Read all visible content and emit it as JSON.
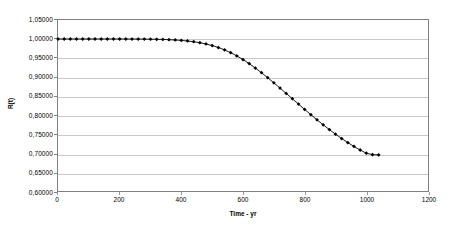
{
  "chart_data": {
    "type": "line",
    "title": "",
    "xlabel": "Time - yr",
    "ylabel": "R(t)",
    "xlim": [
      0,
      1200
    ],
    "ylim": [
      0.6,
      1.05
    ],
    "grid": true,
    "legend": null,
    "decimal_separator": ",",
    "marker": "diamond",
    "marker_color": "#000000",
    "line_color": "#000000",
    "grid_color": "#c9c9c9",
    "frame_color": "#808080",
    "x_ticks": [
      0,
      200,
      400,
      600,
      800,
      1000,
      1200
    ],
    "x_tick_labels": [
      "0",
      "200",
      "400",
      "600",
      "800",
      "1000",
      "1200"
    ],
    "y_ticks": [
      0.6,
      0.65,
      0.7,
      0.75,
      0.8,
      0.85,
      0.9,
      0.95,
      1.0,
      1.05
    ],
    "y_tick_labels": [
      "0,60000",
      "0,65000",
      "0,70000",
      "0,75000",
      "0,80000",
      "0,85000",
      "0,90000",
      "0,95000",
      "1,00000",
      "1,05000"
    ],
    "series": [
      {
        "name": "R(t)",
        "x": [
          0,
          20,
          40,
          60,
          80,
          100,
          120,
          140,
          160,
          180,
          200,
          220,
          240,
          260,
          280,
          300,
          320,
          340,
          360,
          380,
          400,
          420,
          440,
          460,
          480,
          500,
          520,
          540,
          560,
          580,
          600,
          620,
          640,
          660,
          680,
          700,
          720,
          740,
          760,
          780,
          800,
          820,
          840,
          860,
          880,
          900,
          920,
          940,
          960,
          980,
          1000,
          1020,
          1040
        ],
        "values": [
          1.0,
          1.0,
          1.0,
          1.0,
          1.0,
          1.0,
          1.0,
          1.0,
          1.0,
          1.0,
          1.0,
          1.0,
          0.9999,
          0.9998,
          0.9997,
          0.9995,
          0.9992,
          0.9988,
          0.9982,
          0.9974,
          0.9963,
          0.9948,
          0.9928,
          0.9902,
          0.9869,
          0.9827,
          0.9776,
          0.9714,
          0.964,
          0.9555,
          0.9459,
          0.9352,
          0.9236,
          0.9112,
          0.8982,
          0.8847,
          0.8709,
          0.8569,
          0.8428,
          0.8287,
          0.8147,
          0.8009,
          0.7874,
          0.7743,
          0.7617,
          0.7496,
          0.7381,
          0.7273,
          0.7172,
          0.7079,
          0.6994,
          0.6957,
          0.695
        ]
      }
    ]
  }
}
